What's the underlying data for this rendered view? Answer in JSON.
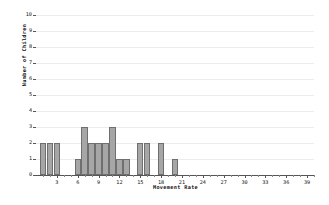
{
  "chart_data": {
    "type": "bar",
    "title": "",
    "xlabel": "Movement Rate",
    "ylabel": "Number of Children",
    "xlim": [
      0,
      40
    ],
    "ylim": [
      0,
      10
    ],
    "grid": true,
    "legend": "none",
    "bar_color": "#a6a6a6",
    "bar_edge_color": "#6f6f6f",
    "x_tick_labels": [
      "3",
      "6",
      "9",
      "12",
      "15",
      "18",
      "21",
      "24",
      "27",
      "30",
      "33",
      "36",
      "39"
    ],
    "x_tick_values": [
      3,
      6,
      9,
      12,
      15,
      18,
      21,
      24,
      27,
      30,
      33,
      36,
      39
    ],
    "x_minor_tick_step": 1,
    "y_tick_labels": [
      "0",
      "1",
      "2",
      "3",
      "4",
      "5",
      "6",
      "7",
      "8",
      "9",
      "10"
    ],
    "y_tick_values": [
      0,
      1,
      2,
      3,
      4,
      5,
      6,
      7,
      8,
      9,
      10
    ],
    "categories": [
      1,
      2,
      3,
      4,
      5,
      6,
      7,
      8,
      9,
      10,
      11,
      12,
      13,
      14,
      15,
      16,
      17,
      18,
      19,
      20,
      21,
      22,
      23,
      24,
      25,
      26,
      27,
      28,
      29,
      30,
      31,
      32,
      33,
      34,
      35,
      36,
      37,
      38,
      39,
      40
    ],
    "values": [
      2,
      2,
      2,
      0,
      0,
      1,
      3,
      2,
      2,
      2,
      3,
      1,
      1,
      0,
      2,
      2,
      0,
      2,
      0,
      1,
      0,
      0,
      0,
      0,
      0,
      0,
      0,
      0,
      0,
      0,
      0,
      0,
      0,
      0,
      0,
      0,
      0,
      0,
      0,
      0
    ],
    "total_children": 25
  }
}
